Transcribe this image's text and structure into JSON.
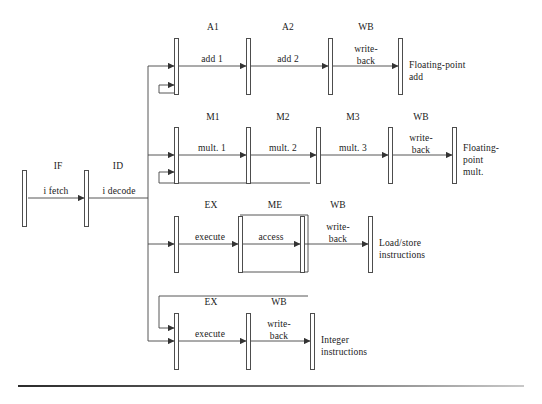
{
  "figure": {
    "ink_color": "#333333",
    "bar_fill": "#ffffff",
    "bar_stroke": "#4d4d4d",
    "background": "#ffffff"
  },
  "front_end": {
    "stages": [
      {
        "id": "IF",
        "stage_label": "IF",
        "action_label": "i fetch"
      },
      {
        "id": "ID",
        "stage_label": "ID",
        "action_label": "i decode"
      }
    ]
  },
  "pipelines": [
    {
      "name": "floating-point-add",
      "output_label": "Floating-point\nadd",
      "output_lines": [
        "Floating-point",
        "add"
      ],
      "stages": [
        {
          "stage_label": "A1",
          "action_label": "add 1"
        },
        {
          "stage_label": "A2",
          "action_label": "add 2"
        },
        {
          "stage_label": "WB",
          "action_label": "write-\nback",
          "action_lines": [
            "write-",
            "back"
          ]
        }
      ]
    },
    {
      "name": "floating-point-mult",
      "output_label": "Floating-\npoint\nmult.",
      "output_lines": [
        "Floating-",
        "point",
        "mult."
      ],
      "stages": [
        {
          "stage_label": "M1",
          "action_label": "mult. 1"
        },
        {
          "stage_label": "M2",
          "action_label": "mult. 2"
        },
        {
          "stage_label": "M3",
          "action_label": "mult. 3"
        },
        {
          "stage_label": "WB",
          "action_label": "write-\nback",
          "action_lines": [
            "write-",
            "back"
          ]
        }
      ]
    },
    {
      "name": "load-store",
      "output_label": "Load/store\ninstructions",
      "output_lines": [
        "Load/store",
        "instructions"
      ],
      "stages": [
        {
          "stage_label": "EX",
          "action_label": "execute"
        },
        {
          "stage_label": "ME",
          "action_label": "access"
        },
        {
          "stage_label": "WB",
          "action_label": "write-\nback",
          "action_lines": [
            "write-",
            "back"
          ]
        }
      ]
    },
    {
      "name": "integer",
      "output_label": "Integer\ninstructions",
      "output_lines": [
        "Integer",
        "instructions"
      ],
      "stages": [
        {
          "stage_label": "EX",
          "action_label": "execute"
        },
        {
          "stage_label": "WB",
          "action_label": "write-\nback",
          "action_lines": [
            "write-",
            "back"
          ]
        }
      ]
    }
  ],
  "labels": {
    "if_stage": "IF",
    "if_action": "i fetch",
    "id_stage": "ID",
    "id_action": "i decode",
    "a1_stage": "A1",
    "a1_action": "add 1",
    "a2_stage": "A2",
    "a2_action": "add 2",
    "wb_add_stage": "WB",
    "wb_add_action_1": "write-",
    "wb_add_action_2": "back",
    "out_add_1": "Floating-point",
    "out_add_2": "add",
    "m1_stage": "M1",
    "m1_action": "mult. 1",
    "m2_stage": "M2",
    "m2_action": "mult. 2",
    "m3_stage": "M3",
    "m3_action": "mult. 3",
    "wb_mult_stage": "WB",
    "wb_mult_action_1": "write-",
    "wb_mult_action_2": "back",
    "out_mult_1": "Floating-",
    "out_mult_2": "point",
    "out_mult_3": "mult.",
    "ex_ls_stage": "EX",
    "ex_ls_action": "execute",
    "me_ls_stage": "ME",
    "me_ls_action": "access",
    "wb_ls_stage": "WB",
    "wb_ls_action_1": "write-",
    "wb_ls_action_2": "back",
    "out_ls_1": "Load/store",
    "out_ls_2": "instructions",
    "ex_int_stage": "EX",
    "ex_int_action": "execute",
    "wb_int_stage": "WB",
    "wb_int_action_1": "write-",
    "wb_int_action_2": "back",
    "out_int_1": "Integer",
    "out_int_2": "instructions"
  }
}
